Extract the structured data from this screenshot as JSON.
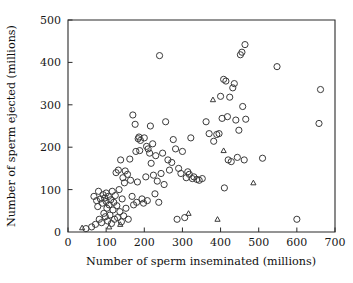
{
  "chart_data": {
    "type": "scatter",
    "title": "",
    "xlabel": "Number of sperm inseminated (millions)",
    "ylabel": "Number of sperm ejected (millions)",
    "xlim": [
      0,
      700
    ],
    "ylim": [
      0,
      500
    ],
    "xticks": [
      0,
      100,
      200,
      300,
      400,
      500,
      600,
      700
    ],
    "yticks": [
      0,
      100,
      200,
      300,
      400,
      500
    ],
    "xtick_labels": [
      "0",
      "100",
      "200",
      "300",
      "400",
      "500",
      "600",
      "700"
    ],
    "ytick_labels": [
      "0",
      "100",
      "200",
      "300",
      "400",
      "500"
    ],
    "grid": false,
    "legend": "none",
    "series": [
      {
        "name": "circles",
        "marker": "open-circle",
        "color": "#3a3a3a",
        "points": [
          [
            47,
            8
          ],
          [
            62,
            12
          ],
          [
            68,
            84
          ],
          [
            72,
            18
          ],
          [
            75,
            74
          ],
          [
            78,
            60
          ],
          [
            80,
            96
          ],
          [
            82,
            30
          ],
          [
            85,
            78
          ],
          [
            88,
            22
          ],
          [
            90,
            68
          ],
          [
            92,
            88
          ],
          [
            94,
            44
          ],
          [
            96,
            80
          ],
          [
            98,
            36
          ],
          [
            100,
            72
          ],
          [
            100,
            92
          ],
          [
            102,
            56
          ],
          [
            104,
            26
          ],
          [
            106,
            84
          ],
          [
            108,
            64
          ],
          [
            110,
            40
          ],
          [
            112,
            76
          ],
          [
            114,
            20
          ],
          [
            116,
            96
          ],
          [
            118,
            52
          ],
          [
            120,
            70
          ],
          [
            122,
            30
          ],
          [
            124,
            86
          ],
          [
            126,
            140
          ],
          [
            128,
            62
          ],
          [
            130,
            34
          ],
          [
            132,
            146
          ],
          [
            134,
            100
          ],
          [
            136,
            48
          ],
          [
            138,
            170
          ],
          [
            140,
            24
          ],
          [
            142,
            78
          ],
          [
            144,
            128
          ],
          [
            146,
            38
          ],
          [
            148,
            116
          ],
          [
            150,
            144
          ],
          [
            152,
            56
          ],
          [
            156,
            136
          ],
          [
            158,
            30
          ],
          [
            162,
            172
          ],
          [
            164,
            122
          ],
          [
            168,
            84
          ],
          [
            170,
            276
          ],
          [
            172,
            64
          ],
          [
            176,
            254
          ],
          [
            178,
            190
          ],
          [
            180,
            70
          ],
          [
            182,
            118
          ],
          [
            184,
            220
          ],
          [
            186,
            224
          ],
          [
            188,
            192
          ],
          [
            190,
            216
          ],
          [
            194,
            78
          ],
          [
            198,
            68
          ],
          [
            200,
            222
          ],
          [
            204,
            130
          ],
          [
            206,
            202
          ],
          [
            208,
            74
          ],
          [
            210,
            196
          ],
          [
            214,
            186
          ],
          [
            216,
            250
          ],
          [
            218,
            162
          ],
          [
            222,
            208
          ],
          [
            224,
            134
          ],
          [
            228,
            90
          ],
          [
            230,
            180
          ],
          [
            234,
            120
          ],
          [
            238,
            70
          ],
          [
            240,
            416
          ],
          [
            244,
            138
          ],
          [
            248,
            186
          ],
          [
            252,
            112
          ],
          [
            256,
            260
          ],
          [
            262,
            170
          ],
          [
            266,
            146
          ],
          [
            272,
            164
          ],
          [
            276,
            218
          ],
          [
            282,
            196
          ],
          [
            286,
            30
          ],
          [
            290,
            150
          ],
          [
            296,
            138
          ],
          [
            300,
            190
          ],
          [
            306,
            34
          ],
          [
            310,
            128
          ],
          [
            314,
            142
          ],
          [
            318,
            136
          ],
          [
            322,
            222
          ],
          [
            326,
            126
          ],
          [
            330,
            130
          ],
          [
            338,
            124
          ],
          [
            344,
            122
          ],
          [
            352,
            126
          ],
          [
            362,
            260
          ],
          [
            370,
            232
          ],
          [
            382,
            214
          ],
          [
            390,
            230
          ],
          [
            396,
            232
          ],
          [
            400,
            320
          ],
          [
            404,
            268
          ],
          [
            408,
            360
          ],
          [
            410,
            104
          ],
          [
            414,
            356
          ],
          [
            418,
            272
          ],
          [
            420,
            170
          ],
          [
            424,
            318
          ],
          [
            428,
            166
          ],
          [
            432,
            340
          ],
          [
            436,
            350
          ],
          [
            440,
            264
          ],
          [
            444,
            176
          ],
          [
            448,
            240
          ],
          [
            452,
            418
          ],
          [
            456,
            424
          ],
          [
            458,
            296
          ],
          [
            462,
            170
          ],
          [
            464,
            442
          ],
          [
            466,
            266
          ],
          [
            510,
            174
          ],
          [
            548,
            390
          ],
          [
            600,
            30
          ],
          [
            658,
            256
          ],
          [
            662,
            336
          ]
        ]
      },
      {
        "name": "triangles",
        "marker": "open-triangle",
        "color": "#3a3a3a",
        "points": [
          [
            37,
            10
          ],
          [
            108,
            12
          ],
          [
            137,
            18
          ],
          [
            316,
            44
          ],
          [
            380,
            312
          ],
          [
            392,
            30
          ],
          [
            408,
            192
          ],
          [
            486,
            116
          ]
        ]
      }
    ]
  }
}
